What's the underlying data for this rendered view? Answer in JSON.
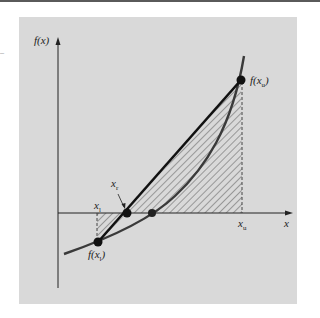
{
  "figure": {
    "labels": {
      "y_axis": "f(x)",
      "x_axis": "x",
      "f_upper": "f(x",
      "f_upper_sub": "u",
      "f_lower": "f(x",
      "f_lower_sub": "l",
      "x_upper": "x",
      "x_upper_sub": "u",
      "x_root_estimate": "x",
      "x_root_estimate_sub": "r",
      "x_lower": "x",
      "x_lower_sub": "l",
      "close_paren": ")"
    },
    "side_mark": "–",
    "colors": {
      "background": "#ffffff",
      "panel": "#d9d9d9",
      "curve": "#333333",
      "secant": "#1a1a1a",
      "hatch": "#333333",
      "axis": "#222222"
    }
  }
}
